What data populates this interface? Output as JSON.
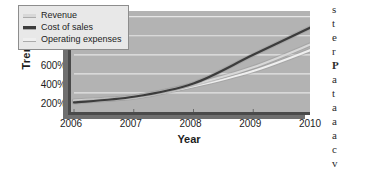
{
  "chart_data": {
    "type": "line",
    "title": "",
    "xlabel": "Year",
    "ylabel": "Trend",
    "x": [
      2006,
      2007,
      2008,
      2009,
      2010
    ],
    "xticklabels": [
      "2006",
      "2007",
      "2008",
      "2009",
      "2010"
    ],
    "yticklabels": [
      "1000%",
      "800%",
      "600%",
      "400%",
      "200%"
    ],
    "yticks": [
      1000,
      800,
      600,
      400,
      200
    ],
    "ylim": [
      0,
      1060
    ],
    "xlim": [
      2006,
      2010
    ],
    "grid": "horizontal",
    "legend_position": "top-left-inside",
    "plot_background": "#b3b3b3",
    "gridline_color": "#e6e6e6",
    "series": [
      {
        "name": "Revenue",
        "color": "#d8d8d8",
        "values": [
          120,
          165,
          290,
          470,
          720
        ]
      },
      {
        "name": "Cost of sales",
        "color": "#3c3c3c",
        "values": [
          100,
          160,
          300,
          600,
          900
        ]
      },
      {
        "name": "Operating expenses",
        "color": "#efefef",
        "values": [
          110,
          150,
          270,
          430,
          660
        ]
      }
    ]
  },
  "legend": {
    "items": [
      {
        "label": "Revenue",
        "color": "#d8d8d8"
      },
      {
        "label": "Cost of sales",
        "color": "#3c3c3c"
      },
      {
        "label": "Operating expenses",
        "color": "#efefef"
      }
    ]
  },
  "page_text_fragments": [
    "s",
    "t",
    "e",
    "r",
    "P",
    "a",
    "t",
    "a",
    "a",
    "a",
    "c",
    "v"
  ]
}
